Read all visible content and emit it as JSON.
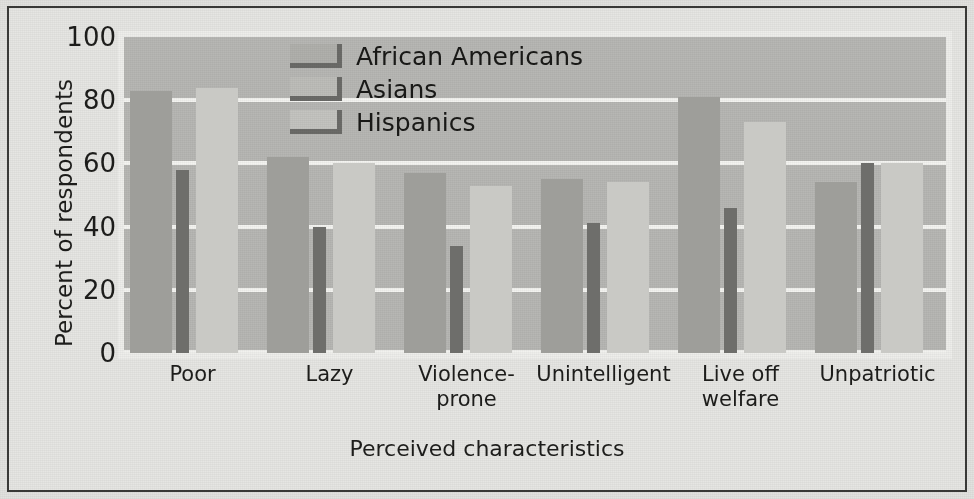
{
  "chart_data": {
    "type": "bar",
    "title": "",
    "xlabel": "Perceived characteristics",
    "ylabel": "Percent of respondents",
    "ylim": [
      0,
      100
    ],
    "yticks": [
      100,
      80,
      60,
      40,
      20,
      0
    ],
    "grid": true,
    "legend_position": "top-center",
    "categories": [
      "Poor",
      "Lazy",
      "Violence-\nprone",
      "Unintelligent",
      "Live off\nwelfare",
      "Unpatriotic"
    ],
    "series": [
      {
        "name": "African Americans",
        "color": "#9e9e9a",
        "values": [
          83,
          62,
          57,
          55,
          81,
          54
        ]
      },
      {
        "name": "Asians",
        "color": "#6e6e6b",
        "values": [
          58,
          40,
          34,
          41,
          46,
          60
        ]
      },
      {
        "name": "Hispanics",
        "color": "#c9c9c5",
        "values": [
          84,
          60,
          53,
          54,
          73,
          60
        ]
      }
    ]
  },
  "axes": {
    "y_title": "Percent of respondents",
    "x_title": "Perceived characteristics",
    "y_tick_labels": [
      "100",
      "80",
      "60",
      "40",
      "20",
      "0"
    ]
  },
  "legend": {
    "entries": [
      {
        "label": "African Americans",
        "swatch": "legend-swatch-african-americans"
      },
      {
        "label": "Asians",
        "swatch": "legend-swatch-asians"
      },
      {
        "label": "Hispanics",
        "swatch": "legend-swatch-hispanics"
      }
    ]
  },
  "colors": {
    "african_americans": "#9e9e9a",
    "asians": "#6e6e6b",
    "hispanics": "#c9c9c5",
    "plot_background": "#b7b7b4",
    "gridline": "#f4f4f1",
    "page_background": "#e6e6e3",
    "frame": "#3a3a38",
    "text": "#1d1d1b"
  }
}
